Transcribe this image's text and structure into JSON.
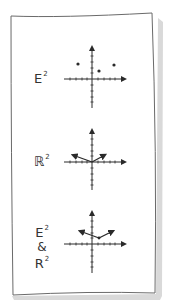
{
  "panels": [
    {
      "id": "euclidean",
      "label_base": "E",
      "label_sup": "2",
      "description": "Points in Euclidean plane",
      "origin": [
        92,
        79
      ],
      "points": [
        [
          78,
          64
        ],
        [
          99,
          71
        ],
        [
          114,
          65
        ]
      ]
    },
    {
      "id": "vector-space",
      "label_base": "ℝ",
      "label_sup": "2",
      "description": "Vectors from origin",
      "origin": [
        92,
        162
      ],
      "vectors": [
        {
          "from": [
            92,
            162
          ],
          "to": [
            72,
            155
          ]
        },
        {
          "from": [
            92,
            162
          ],
          "to": [
            105,
            155
          ]
        }
      ]
    },
    {
      "id": "combined",
      "label_line1_base": "E",
      "label_line1_sup": "2",
      "label_amp": "&",
      "label_line2_base": "R",
      "label_line2_sup": "2",
      "description": "Vectors anchored at a point",
      "origin": [
        92,
        244
      ],
      "anchor": [
        99,
        238
      ],
      "vectors": [
        {
          "from": [
            99,
            238
          ],
          "to": [
            79,
            231
          ]
        },
        {
          "from": [
            99,
            238
          ],
          "to": [
            113,
            231
          ]
        }
      ]
    }
  ],
  "colors": {
    "ink": "#2a2a2a",
    "paper": "#ffffff",
    "shadow": "#c8c8c8",
    "border": "#6a6a6a"
  }
}
